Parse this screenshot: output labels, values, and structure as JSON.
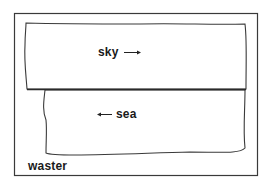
{
  "diagram": {
    "frame": {
      "label": "waster"
    },
    "regions": [
      {
        "name": "sky",
        "label": "sky",
        "arrow": "right"
      },
      {
        "name": "sea",
        "label": "sea",
        "arrow": "left"
      }
    ],
    "colors": {
      "stroke": "#333333",
      "background": "#ffffff"
    }
  }
}
